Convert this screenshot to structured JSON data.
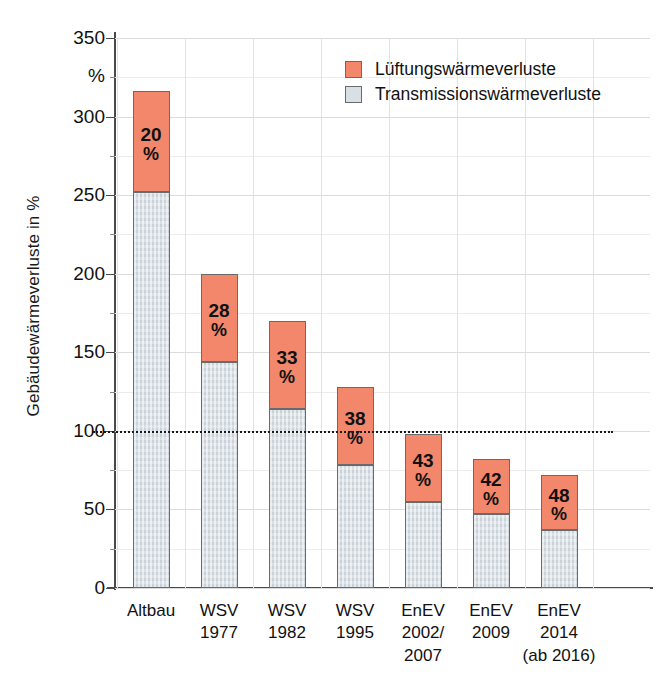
{
  "chart_data": {
    "type": "bar",
    "stacked": true,
    "title": "",
    "xlabel": "",
    "ylabel": "Gebäudewärmeverluste in %",
    "yunit": "%",
    "ylim": [
      0,
      350
    ],
    "yticks": [
      0,
      50,
      100,
      150,
      200,
      250,
      300,
      350
    ],
    "ytick_labels": [
      "0",
      "50",
      "100",
      "150",
      "200",
      "250",
      "300",
      "350"
    ],
    "grid": true,
    "legend_position": "top-right",
    "reference_line": {
      "value": 100,
      "style": "dotted"
    },
    "categories": [
      "Altbau",
      "WSV 1977",
      "WSV 1982",
      "WSV 1995",
      "EnEV 2002/2007",
      "EnEV 2009",
      "EnEV 2014 (ab 2016)"
    ],
    "category_lines": [
      [
        "Altbau"
      ],
      [
        "WSV",
        "1977"
      ],
      [
        "WSV",
        "1982"
      ],
      [
        "WSV",
        "1995"
      ],
      [
        "EnEV",
        "2002/",
        "2007"
      ],
      [
        "EnEV",
        "2009"
      ],
      [
        "EnEV",
        "2014",
        "(ab 2016)"
      ]
    ],
    "series": [
      {
        "name": "Transmissionswärmeverluste",
        "color": "#d9dfe4",
        "values": [
          252,
          144,
          114,
          78,
          55,
          47,
          37
        ]
      },
      {
        "name": "Lüftungswärmeverluste",
        "color": "#f2876b",
        "values": [
          64,
          56,
          56,
          50,
          43,
          35,
          35
        ]
      }
    ],
    "totals": [
      316,
      200,
      170,
      128,
      98,
      82,
      72
    ],
    "data_labels": [
      "20",
      "28",
      "33",
      "38",
      "43",
      "42",
      "48"
    ],
    "data_label_unit": "%"
  },
  "legend": {
    "items": [
      {
        "label": "Lüftungswärmeverluste",
        "color": "#f2876b"
      },
      {
        "label": "Transmissionswärmeverluste",
        "color": "#d9dfe4"
      }
    ]
  },
  "colors": {
    "ventilation": "#f2876b",
    "transmission": "#d9dfe4",
    "axis": "#4a4a4a",
    "grid": "#e2e2e2",
    "text": "#111111"
  }
}
